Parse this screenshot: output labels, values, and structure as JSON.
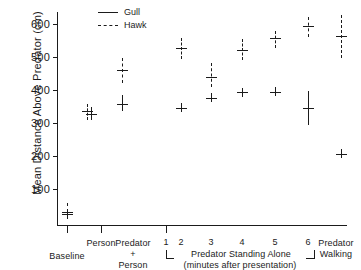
{
  "chart_data": {
    "type": "scatter",
    "title": "",
    "xlabel": "",
    "ylabel": "Mean Distance Above Predator  (cm)",
    "ylim": [
      0,
      650
    ],
    "yticks": [
      100,
      200,
      300,
      400,
      500,
      600
    ],
    "ytick_labels": [
      "100",
      "200",
      "300",
      "400",
      "500",
      "600"
    ],
    "grid": false,
    "legend_position": "top-left",
    "legend": [
      {
        "name": "Gull",
        "style": "solid"
      },
      {
        "name": "Hawk",
        "style": "dashed"
      }
    ],
    "categories": [
      "Baseline",
      "Person",
      "Predator + Person",
      "1",
      "2",
      "3",
      "4",
      "5",
      "6",
      "Predator Walking"
    ],
    "group_labels": {
      "baseline": "Baseline",
      "person": "Person",
      "predator_person_line1": "Predator",
      "predator_person_line2": "+",
      "predator_person_line3": "Person",
      "standing_alone_line1": "Predator  Standing  Alone",
      "standing_alone_line2": "(minutes  after  presentation)",
      "minutes": [
        "1",
        "2",
        "3",
        "4",
        "5",
        "6"
      ],
      "walking_line1": "Predator",
      "walking_line2": "Walking"
    },
    "series": [
      {
        "name": "Gull",
        "style": "solid",
        "points": [
          {
            "category": "Baseline",
            "mean": 25,
            "low": 25,
            "high": 25
          },
          {
            "category": "Person",
            "mean": 328,
            "low": 310,
            "high": 350
          },
          {
            "category": "Predator + Person",
            "mean": 360,
            "low": 338,
            "high": 385
          },
          {
            "category": "1",
            "mean": null,
            "low": null,
            "high": null
          },
          {
            "category": "2",
            "mean": 348,
            "low": 348,
            "high": 348
          },
          {
            "category": "3",
            "mean": 378,
            "low": 378,
            "high": 378
          },
          {
            "category": "4",
            "mean": 394,
            "low": 394,
            "high": 394
          },
          {
            "category": "5",
            "mean": 396,
            "low": 396,
            "high": 396
          },
          {
            "category": "6",
            "mean": 348,
            "low": 295,
            "high": 400
          },
          {
            "category": "Predator Walking",
            "mean": 209,
            "low": 209,
            "high": 209
          }
        ]
      },
      {
        "name": "Hawk",
        "style": "dashed",
        "points": [
          {
            "category": "Baseline",
            "mean": 33,
            "low": 33,
            "high": 60
          },
          {
            "category": "Person",
            "mean": 338,
            "low": 312,
            "high": 360
          },
          {
            "category": "Predator + Person",
            "mean": 462,
            "low": 424,
            "high": 500
          },
          {
            "category": "1",
            "mean": null,
            "low": null,
            "high": null
          },
          {
            "category": "2",
            "mean": 529,
            "low": 496,
            "high": 560
          },
          {
            "category": "3",
            "mean": 440,
            "low": 412,
            "high": 482
          },
          {
            "category": "4",
            "mean": 524,
            "low": 492,
            "high": 557
          },
          {
            "category": "5",
            "mean": 559,
            "low": 530,
            "high": 580
          },
          {
            "category": "6",
            "mean": 596,
            "low": 562,
            "high": 622
          },
          {
            "category": "Predator Walking",
            "mean": 566,
            "low": 498,
            "high": 630
          }
        ]
      }
    ]
  }
}
